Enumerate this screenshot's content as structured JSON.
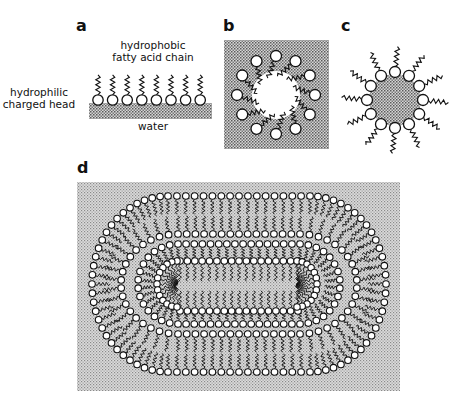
{
  "figure": {
    "panels": [
      {
        "id": "a",
        "label": "a",
        "description": "Monolayer of fatty acids at water surface"
      },
      {
        "id": "b",
        "label": "b",
        "description": "Reverse micelle in oil with water core"
      },
      {
        "id": "c",
        "label": "c",
        "description": "Micelle in water with hydrophobic core"
      },
      {
        "id": "d",
        "label": "d",
        "description": "Multilamellar vesicle with bilayers enclosing inner elongated micelle"
      }
    ],
    "annotations": {
      "tail_label_line1": "hydrophobic",
      "tail_label_line2": "fatty acid chain",
      "head_label_line1": "hydrophilic",
      "head_label_line2": "charged head",
      "water_label": "water"
    },
    "colors": {
      "ink": "#111111",
      "background": "#ffffff",
      "stipple_light": "#c8c8c8",
      "stipple_dark": "#6e6e6e"
    },
    "panel_a": {
      "head_count": 8
    },
    "panel_b": {
      "head_count": 12
    },
    "panel_c": {
      "head_count": 12
    },
    "panel_d": {
      "outer_top_row_count": 18,
      "inner_micelle_row_count": 17
    }
  }
}
